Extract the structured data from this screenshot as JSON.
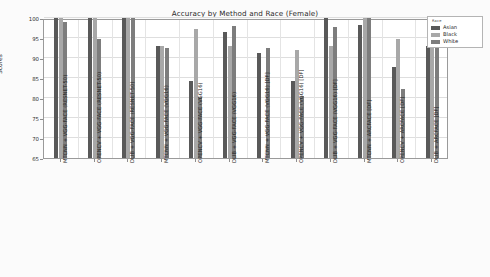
{
  "chart_data": {
    "type": "bar",
    "title": "Accuracy by Method and Race (Female)",
    "xlabel": "",
    "ylabel": "Scores",
    "ylim": [
      65,
      100
    ],
    "yticks": [
      65,
      70,
      75,
      80,
      85,
      90,
      95,
      100
    ],
    "grid": true,
    "legend_title": "Race",
    "legend_position": "upper right",
    "categories": [
      "MTCNN + VGG-FACE (RESNET-50)",
      "OPENCV + VGG-FACE (RESNET-50)",
      "DLIB + VGG-FACE (RESNET-50)",
      "MTCNN + VGG-FACE (VGG16)",
      "OPENCV + VGG-FACE (VGG16)",
      "DLIB + VGG-FACE (VGG16)",
      "MTCNN + VGG-FACE (VGG16) [DF]",
      "OPENCV + VGG-FACE (VGG16) [DF]",
      "DLIB + VGG-FACE (VGG16) [DF]",
      "MTCNN + ARCFACE [DF]",
      "OPENCV + ARCFACE [DF]",
      "DLIB + ARCFACE [DF]"
    ],
    "series": [
      {
        "name": "Asian",
        "color": "#595959",
        "values": [
          100.0,
          100.0,
          100.0,
          92.9,
          84.2,
          96.5,
          91.3,
          84.2,
          100.0,
          98.3,
          87.8,
          93.0
        ]
      },
      {
        "name": "Black",
        "color": "#a8a8a8",
        "values": [
          100.0,
          100.0,
          100.0,
          93.0,
          97.3,
          93.0,
          65.0,
          92.1,
          93.0,
          100.0,
          94.8,
          93.0
        ]
      },
      {
        "name": "White",
        "color": "#7d7d7d",
        "values": [
          99.0,
          94.8,
          100.0,
          92.5,
          80.2,
          98.0,
          92.6,
          80.5,
          97.7,
          100.0,
          82.3,
          93.0
        ]
      }
    ]
  }
}
